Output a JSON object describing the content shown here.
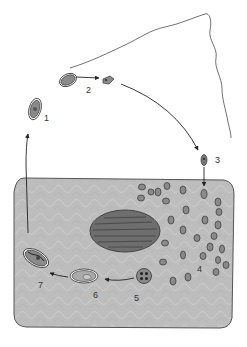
{
  "diagram": {
    "type": "life-cycle",
    "stages": [
      {
        "id": 1,
        "label": "1",
        "description": "mature cyst (external)"
      },
      {
        "id": 2,
        "label": "2",
        "description": "excystation, released sporozoite"
      },
      {
        "id": 3,
        "label": "3",
        "description": "organism entering host cell"
      },
      {
        "id": 4,
        "label": "4",
        "description": "multiplying stages within cell cytoplasm"
      },
      {
        "id": 5,
        "label": "5",
        "description": "sporont with four nuclei"
      },
      {
        "id": 6,
        "label": "6",
        "description": "young cyst"
      },
      {
        "id": 7,
        "label": "7",
        "description": "mature cyst leaving cell"
      }
    ],
    "colors": {
      "cell_fill": "#bdbdbd",
      "cell_border": "#555555",
      "nucleus_fill": "#6e6e6e",
      "organism_fill": "#8a8a8a",
      "line": "#222222",
      "background": "#ffffff"
    }
  }
}
